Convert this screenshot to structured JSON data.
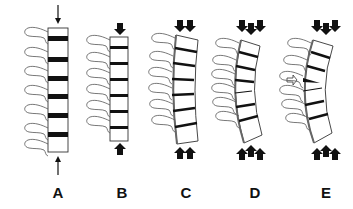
{
  "figure": {
    "panels": [
      {
        "id": "A",
        "label": "A",
        "arrows_top": 1,
        "arrows_bottom": 1,
        "x": 58
      },
      {
        "id": "B",
        "label": "B",
        "arrows_top": 1,
        "arrows_bottom": 1,
        "x": 122
      },
      {
        "id": "C",
        "label": "C",
        "arrows_top": 2,
        "arrows_bottom": 2,
        "x": 186
      },
      {
        "id": "D",
        "label": "D",
        "arrows_top": 3,
        "arrows_bottom": 3,
        "x": 255
      },
      {
        "id": "E",
        "label": "E",
        "arrows_top": 3,
        "arrows_bottom": 3,
        "x": 326
      }
    ],
    "colors": {
      "ink": "#111111",
      "line": "#555555",
      "background": "#ffffff"
    }
  }
}
